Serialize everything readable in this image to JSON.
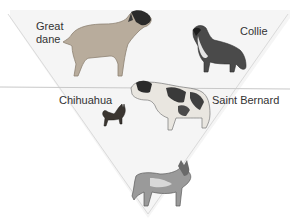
{
  "figure": {
    "title": "",
    "colors": {
      "background": "#ffffff",
      "triangle_fill": "#ebebeb",
      "triangle_edge": "#d6d6d6",
      "divider_line": "#c8c8c8",
      "label_text": "#333333"
    },
    "labels": {
      "great_dane_line1": "Great",
      "great_dane_line2": "dane",
      "collie": "Collie",
      "chihuahua": "Chihuahua",
      "saint_bernard": "Saint Bernard"
    },
    "animals": [
      {
        "name": "great-dane",
        "label": "Great dane"
      },
      {
        "name": "collie",
        "label": "Collie"
      },
      {
        "name": "chihuahua",
        "label": "Chihuahua"
      },
      {
        "name": "saint-bernard",
        "label": "Saint Bernard"
      },
      {
        "name": "wolf",
        "label": ""
      }
    ]
  }
}
